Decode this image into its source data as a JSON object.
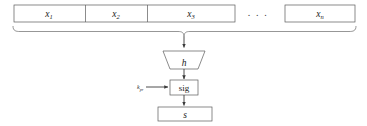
{
  "diagram": {
    "type": "flow-diagram",
    "colors": {
      "stroke": "#5a5a5a",
      "arrow": "#3a3a3a",
      "brace": "#6a6a6a",
      "text": "#1a1a1a",
      "background": "#ffffff"
    },
    "message_blocks": {
      "name": "message-block-row",
      "items": [
        {
          "base": "x",
          "subscript": "1"
        },
        {
          "base": "x",
          "subscript": "2"
        },
        {
          "base": "x",
          "subscript": "3"
        },
        {
          "base": "x",
          "subscript": "n"
        }
      ],
      "ellipsis": ". . ."
    },
    "hash_node": {
      "label": "h",
      "shape": "trapezoid"
    },
    "sign_node": {
      "label": "sig",
      "shape": "rectangle"
    },
    "key_input": {
      "base": "k",
      "subscript": "pr"
    },
    "output_node": {
      "label": "s",
      "shape": "rectangle"
    }
  }
}
